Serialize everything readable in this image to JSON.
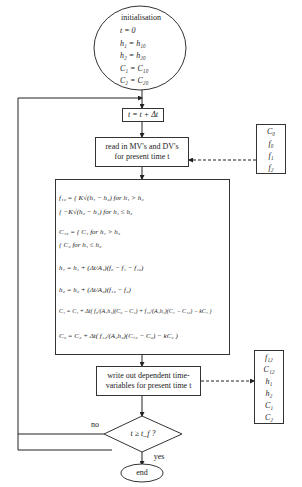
{
  "init": {
    "title": "initialisation",
    "lines": [
      "t = 0",
      "h₁ = h₁₀",
      "h₂ = h₂₀",
      "C₁ = C₁₀",
      "C₂ = C₂₀"
    ]
  },
  "time_step": "t = t + Δt",
  "read_step": {
    "line1": "read in MV's and DV's",
    "line2": "for present time t"
  },
  "inputs_box": [
    "C₀",
    "f₀",
    "f₁",
    "f₂"
  ],
  "equations": [
    "f₁₂ = {  K√(h₁ − h₂)    for   h₁ > h₂",
    "          { −K√(h₂ − h₁)   for   h₁ ≤ h₂",
    "C₁₂ = {  C₁               for   h₁ > h₂",
    "          {  C₂               for   h₁ ≤ h₂",
    "h₁ = h₁ + (Δt/A₁)(f₀ − f₁ − f₁₂)",
    "h₂ = h₂ + (Δt/A₂)(f₁₂ − f₂)",
    "C₁ = C₁ + Δt( f₀/(A₁h₁)(C₀ − C₁) + f₁₂/(A₁h₁)(C₁ − C₁₂) − kC₁ )",
    "C₂ = C₂ + Δt( f₁₂/(A₂h₂)(C₁₂ − C₂) − kC₂ )"
  ],
  "write_step": {
    "line1": "write out dependent time-",
    "line2": "variables for present time t"
  },
  "outputs_box": [
    "f₁₂",
    "C₁₂",
    "h₁",
    "h₂",
    "C₁",
    "C₂"
  ],
  "decision": {
    "label": "t ≥ t_f  ?",
    "no_label": "no",
    "yes_label": "yes"
  },
  "end": "end"
}
